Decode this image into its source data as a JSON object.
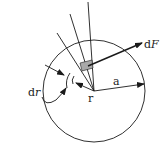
{
  "diagram": {
    "labels": {
      "force": "d",
      "force_var": "F",
      "radius_outer": "a",
      "radius_inner": "r",
      "thickness": "d",
      "thickness_var": "r"
    },
    "colors": {
      "stroke": "#1a1a1a",
      "element_fill": "#a9a9a9",
      "background": "#ffffff"
    }
  }
}
